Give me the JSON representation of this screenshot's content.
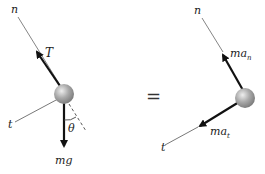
{
  "diagram": {
    "left": {
      "labels": {
        "n_axis": "n",
        "t_axis": "t",
        "tension": "T",
        "weight": "mg",
        "angle": "θ"
      }
    },
    "equals": "=",
    "right": {
      "labels": {
        "n_axis": "n",
        "t_axis": "t",
        "normal_accel": "ma",
        "normal_sub": "n",
        "tangential_accel": "ma",
        "tangential_sub": "t"
      }
    },
    "colors": {
      "ball": "#a8a8a8",
      "arrow": "#111111",
      "axis": "#555555"
    }
  }
}
